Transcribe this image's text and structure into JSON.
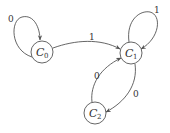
{
  "diagram": {
    "type": "state-transition-graph",
    "nodes": [
      {
        "id": "C0",
        "base": "C",
        "sub": "0",
        "cx": 42,
        "cy": 52,
        "r": 11
      },
      {
        "id": "C1",
        "base": "C",
        "sub": "1",
        "cx": 131,
        "cy": 53,
        "r": 11
      },
      {
        "id": "C2",
        "base": "C",
        "sub": "2",
        "cx": 95,
        "cy": 113,
        "r": 11
      }
    ],
    "edges": [
      {
        "from": "C0",
        "to": "C0",
        "label": "0",
        "kind": "self-loop"
      },
      {
        "from": "C0",
        "to": "C1",
        "label": "1",
        "kind": "curve"
      },
      {
        "from": "C1",
        "to": "C1",
        "label": "1",
        "kind": "self-loop"
      },
      {
        "from": "C2",
        "to": "C1",
        "label": "0",
        "kind": "curve"
      },
      {
        "from": "C1",
        "to": "C2",
        "label": "0",
        "kind": "curve"
      }
    ]
  },
  "labels": {
    "loop_c0": "0",
    "edge_c0_c1": "1",
    "loop_c1": "1",
    "edge_c2_c1": "0",
    "edge_c1_c2": "0",
    "node_c0_base": "C",
    "node_c0_sub": "0",
    "node_c1_base": "C",
    "node_c1_sub": "1",
    "node_c2_base": "C",
    "node_c2_sub": "2"
  },
  "colors": {
    "stroke": "#555555",
    "text": "#333333",
    "background": "#ffffff"
  }
}
